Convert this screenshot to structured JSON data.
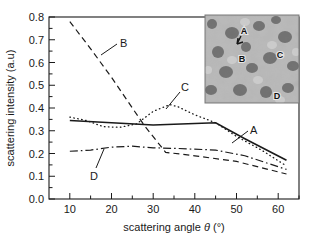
{
  "chart_data": {
    "type": "line",
    "title": "",
    "xlabel": "scattering angle θ (°)",
    "ylabel": "scattering intensity (a.u)",
    "xlim": [
      5,
      65
    ],
    "ylim": [
      0.0,
      0.8
    ],
    "xticks": [
      10,
      20,
      30,
      40,
      50,
      60
    ],
    "yticks": [
      0.0,
      0.1,
      0.2,
      0.3,
      0.4,
      0.5,
      0.6,
      0.7,
      0.8
    ],
    "xtick_labels": [
      "10",
      "20",
      "30",
      "40",
      "50",
      "60"
    ],
    "ytick_labels": [
      "0.0",
      "0.1",
      "0.2",
      "0.3",
      "0.4",
      "0.5",
      "0.6",
      "0.7",
      "0.8"
    ],
    "grid": false,
    "legend": "inline-labels",
    "series": [
      {
        "name": "A",
        "style": "solid",
        "label": "A",
        "x": [
          10,
          20,
          30,
          40,
          45,
          52,
          62
        ],
        "values": [
          0.345,
          0.335,
          0.325,
          0.332,
          0.335,
          0.265,
          0.17
        ]
      },
      {
        "name": "B",
        "style": "dashed",
        "label": "B",
        "x": [
          10,
          15,
          20,
          25,
          28,
          33,
          40,
          50,
          62
        ],
        "values": [
          0.78,
          0.66,
          0.535,
          0.4,
          0.32,
          0.205,
          0.19,
          0.165,
          0.11
        ]
      },
      {
        "name": "C",
        "style": "dotted",
        "label": "C",
        "x": [
          10,
          14,
          18,
          22,
          26,
          30,
          34,
          36,
          40,
          45,
          50,
          56,
          62
        ],
        "values": [
          0.36,
          0.345,
          0.318,
          0.315,
          0.33,
          0.385,
          0.415,
          0.405,
          0.37,
          0.335,
          0.275,
          0.215,
          0.145
        ]
      },
      {
        "name": "D",
        "style": "dashdot",
        "label": "D",
        "x": [
          10,
          15,
          20,
          25,
          30,
          36,
          45,
          52,
          62
        ],
        "values": [
          0.21,
          0.215,
          0.228,
          0.232,
          0.225,
          0.222,
          0.215,
          0.19,
          0.13
        ]
      }
    ]
  },
  "axis": {
    "xlabel_prefix": "scattering angle ",
    "xlabel_symbol": "θ",
    "xlabel_unit": " (°)",
    "ylabel": "scattering intensity (a.u)"
  },
  "inset": {
    "name": "micrograph-inset",
    "description": "grayscale speckle micrograph",
    "labels": [
      {
        "text": "A",
        "x": 0.42,
        "y": 0.19
      },
      {
        "text": "B",
        "x": 0.4,
        "y": 0.5
      },
      {
        "text": "C",
        "x": 0.8,
        "y": 0.47
      },
      {
        "text": "D",
        "x": 0.77,
        "y": 0.93
      }
    ]
  },
  "colors": {
    "ink": "#1a1a1a",
    "background": "#ffffff",
    "inset_border": "#7a7a7a"
  }
}
